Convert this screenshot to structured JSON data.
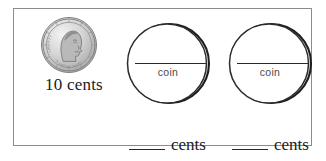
{
  "worksheet": {
    "title": "Coin value worksheet",
    "given_coin": {
      "icon": "us-dime-coin",
      "coin_name": "dime",
      "obverse_text": [
        "LIBERTY",
        "IN GOD WE TRUST"
      ],
      "value_label": "10 cents"
    },
    "blank_coins": [
      {
        "icon": "blank-coin-circle",
        "inner_label": "coin",
        "answer_blank": "",
        "answer_unit": "cents"
      },
      {
        "icon": "blank-coin-circle",
        "inner_label": "coin",
        "answer_blank": "",
        "answer_unit": "cents"
      }
    ]
  },
  "colors": {
    "frame_border": "#8b8b8b",
    "ink": "#1b1b1b",
    "rule": "#2a2a2a",
    "muted_text": "#4a4a4a",
    "page_background": "#ffffff",
    "coin_silver": "#d8d8d8"
  }
}
